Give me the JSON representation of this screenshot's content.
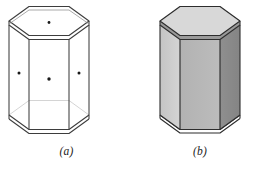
{
  "figure": {
    "background_color": "#ffffff",
    "width": 267,
    "height": 172,
    "panels": [
      {
        "id": "a",
        "caption": "(a)",
        "shape": "hexagonal-prism",
        "style": "wireframe-transparent",
        "description": "Transparent hexagonal prism showing three marked points, one centered on each visible lateral face",
        "marked_points": 3,
        "point_color": "#1a1a1a",
        "outline_color": "#3a3a3a",
        "hidden_edge_color": "#c9c9c9",
        "face_fill": "#ffffff"
      },
      {
        "id": "b",
        "caption": "(b)",
        "shape": "hexagonal-prism",
        "style": "shaded-solid",
        "description": "Shaded hexagonal prism with three visible lateral faces rendered in graduated grays",
        "marked_points": 0,
        "outline_color": "#2b2b2b",
        "hidden_edge_color": "#a8a8a8",
        "top_face_fill": "#d6d6d6",
        "left_face_fill": "#cccccc",
        "front_face_fill": "#b4b4b4",
        "right_face_fill": "#8f8f8f"
      }
    ]
  },
  "figure_a": {
    "caption": "(a)",
    "icon_names": {
      "top_cap": "hexagon-top-face",
      "body": "prism-body",
      "points": "face-center-dot"
    }
  },
  "figure_b": {
    "caption": "(b)",
    "icon_names": {
      "top_cap": "hexagon-top-face",
      "body": "prism-body-shaded"
    }
  }
}
